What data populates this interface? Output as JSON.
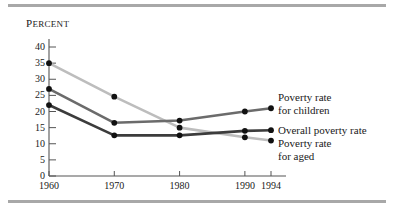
{
  "chart_data": {
    "type": "line",
    "title": "",
    "xlabel": "",
    "ylabel": "PERCENT",
    "ylabel_display": "Percent",
    "x": [
      1960,
      1970,
      1980,
      1990,
      1994
    ],
    "xtick_labels": [
      "1960",
      "1970",
      "1980",
      "1990",
      "1994"
    ],
    "ytick_labels": [
      "0",
      "5",
      "10",
      "15",
      "20",
      "25",
      "30",
      "35",
      "40"
    ],
    "ytick_values": [
      0,
      5,
      10,
      15,
      20,
      25,
      30,
      35,
      40
    ],
    "ylim": [
      0,
      40
    ],
    "xlim": [
      1960,
      1994
    ],
    "grid": false,
    "legend_position": "right-inline",
    "markers": "filled-circle",
    "series": [
      {
        "name": "Poverty rate for children",
        "label_lines": [
          "Poverty rate",
          "for children"
        ],
        "color": "#6b6b6b",
        "values": [
          27,
          16.5,
          17.2,
          20.0,
          21.0
        ]
      },
      {
        "name": "Overall poverty rate",
        "label_lines": [
          "Overall poverty rate"
        ],
        "color": "#3c3c3c",
        "values": [
          22,
          12.6,
          12.6,
          14.0,
          14.2
        ]
      },
      {
        "name": "Poverty rate for aged",
        "label_lines": [
          "Poverty rate",
          "for aged"
        ],
        "color": "#bdbdbd",
        "values": [
          35,
          24.6,
          15.0,
          12.0,
          11.0
        ]
      }
    ],
    "colors": {
      "children": "#6b6b6b",
      "overall": "#3c3c3c",
      "aged": "#bdbdbd",
      "axis": "#555555",
      "marker": "#111111",
      "rule": "#a8a8a8"
    }
  }
}
